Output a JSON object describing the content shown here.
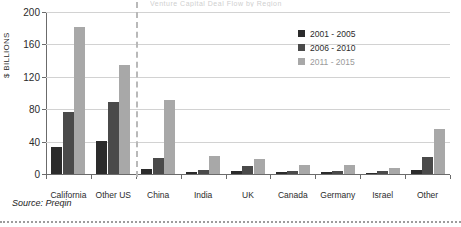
{
  "figure": {
    "title_faint": "Venture Capital Deal Flow by Region",
    "source_label": "Source: Preqin"
  },
  "legend": {
    "position": "top-right",
    "items": [
      {
        "label": "2001 - 2005",
        "color": "#2b2b2b",
        "muted": false
      },
      {
        "label": "2006 - 2010",
        "color": "#4a4a4a",
        "muted": false
      },
      {
        "label": "2011 - 2015",
        "color": "#a8a8a8",
        "muted": true
      }
    ]
  },
  "chart_data": {
    "type": "bar",
    "title": "",
    "xlabel": "",
    "ylabel": "$ BILLIONS",
    "ylim": [
      0,
      200
    ],
    "yticks": [
      0,
      40,
      80,
      120,
      160,
      200
    ],
    "grid": true,
    "categories": [
      "California",
      "Other US",
      "China",
      "India",
      "UK",
      "Canada",
      "Germany",
      "Israel",
      "Other"
    ],
    "series": [
      {
        "name": "2001 - 2005",
        "color": "#2b2b2b",
        "values": [
          33,
          41,
          6,
          2,
          4,
          2,
          2,
          1,
          5
        ]
      },
      {
        "name": "2006 - 2010",
        "color": "#4a4a4a",
        "values": [
          77,
          89,
          20,
          5,
          10,
          4,
          4,
          4,
          21
        ]
      },
      {
        "name": "2011 - 2015",
        "color": "#a8a8a8",
        "values": [
          181,
          135,
          91,
          22,
          18,
          11,
          11,
          7,
          55
        ]
      }
    ],
    "separator_after_category": "Other US"
  }
}
